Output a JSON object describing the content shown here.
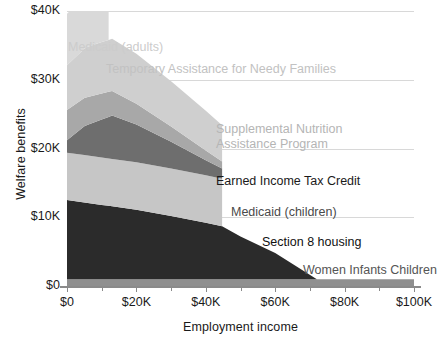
{
  "chart_data": {
    "type": "area",
    "title": "",
    "xlabel": "Employment income",
    "ylabel": "Welfare benefits",
    "xlim": [
      0,
      100000
    ],
    "ylim": [
      0,
      40000
    ],
    "grid": true,
    "legend_position": "inline-annotations",
    "xticks": [
      {
        "value": 0,
        "label": "$0"
      },
      {
        "value": 20000,
        "label": "$20K"
      },
      {
        "value": 40000,
        "label": "$40K"
      },
      {
        "value": 60000,
        "label": "$60K"
      },
      {
        "value": 80000,
        "label": "$80K"
      },
      {
        "value": 100000,
        "label": "$100K"
      }
    ],
    "xminorticks": [
      10000,
      30000,
      50000,
      70000,
      90000
    ],
    "yticks": [
      {
        "value": 0,
        "label": "$0"
      },
      {
        "value": 10000,
        "label": "$10K"
      },
      {
        "value": 20000,
        "label": "$20K"
      },
      {
        "value": 30000,
        "label": "$30K"
      },
      {
        "value": 40000,
        "label": "$40K"
      }
    ],
    "stack_order_top_to_bottom": [
      "Medicaid (adults)",
      "Temporary Assistance for Needy Families",
      "Supplemental Nutrition Assistance Program",
      "Earned Income Tax Credit",
      "Medicaid (children)",
      "Section 8 housing",
      "Women Infants Children"
    ],
    "series": [
      {
        "name": "Women Infants Children",
        "color": "#8f8f8f",
        "x": [
          0,
          100000
        ],
        "values": [
          1000,
          1000
        ]
      },
      {
        "name": "Section 8 housing",
        "color": "#2b2b2b",
        "x": [
          0,
          10000,
          20000,
          30000,
          40000,
          44700,
          50000,
          60000,
          72000,
          100000
        ],
        "values": [
          11500,
          10800,
          10100,
          9200,
          8200,
          7700,
          6200,
          3800,
          0,
          0
        ]
      },
      {
        "name": "Medicaid (children)",
        "color": "#c6c6c6",
        "x": [
          0,
          10000,
          20000,
          30000,
          40000,
          44700,
          44700,
          100000
        ],
        "values": [
          6900,
          6900,
          6900,
          6900,
          6900,
          6900,
          0,
          0
        ]
      },
      {
        "name": "Earned Income Tax Credit",
        "color": "#6e6e6e",
        "x": [
          0,
          5000,
          13000,
          20000,
          30000,
          40000,
          44700,
          44700,
          100000
        ],
        "values": [
          1800,
          4200,
          6300,
          5500,
          3900,
          2200,
          1500,
          0,
          0
        ]
      },
      {
        "name": "Supplemental Nutrition Assistance Program",
        "color": "#a8a8a8",
        "x": [
          0,
          10000,
          20000,
          30000,
          40000,
          44700,
          44700,
          100000
        ],
        "values": [
          4400,
          3800,
          3000,
          2200,
          1400,
          1000,
          0,
          0
        ]
      },
      {
        "name": "Temporary Assistance for Needy Families",
        "color": "#cfcfcf",
        "x": [
          0,
          6000,
          13000,
          20000,
          30000,
          40000,
          44700,
          44700,
          100000
        ],
        "values": [
          6500,
          7300,
          7600,
          7300,
          6600,
          5800,
          5300,
          0,
          0
        ]
      },
      {
        "name": "Medicaid (adults)",
        "color": "#d9d9d9",
        "x": [
          0,
          12000,
          12000,
          100000
        ],
        "values": [
          7500,
          7500,
          0,
          0
        ]
      }
    ],
    "annotations": [
      {
        "text": "Medicaid (adults)",
        "color": "#cccccc",
        "x": 68,
        "y": 40,
        "lines": 1
      },
      {
        "text": "Temporary Assistance for Needy Families",
        "color": "#c2c2c2",
        "x": 106,
        "y": 62,
        "lines": 1
      },
      {
        "text": "Supplemental Nutrition\nAssistance Program",
        "color": "#b5b5b5",
        "x": 216,
        "y": 122,
        "lines": 2
      },
      {
        "text": "Earned Income Tax Credit",
        "color": "#1a1a1a",
        "x": 216,
        "y": 174,
        "lines": 1
      },
      {
        "text": "Medicaid (children)",
        "color": "#4a4a4a",
        "x": 231,
        "y": 205,
        "lines": 1
      },
      {
        "text": "Section 8 housing",
        "color": "#111111",
        "x": 262,
        "y": 235,
        "lines": 1
      },
      {
        "text": "Women Infants Children",
        "color": "#555555",
        "x": 303,
        "y": 263,
        "lines": 1
      }
    ]
  }
}
